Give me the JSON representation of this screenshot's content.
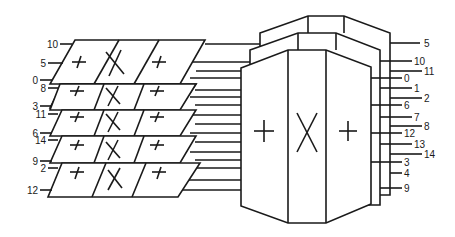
{
  "diagram": {
    "colors": {
      "line": "#1a1a1a",
      "background": "#ffffff"
    },
    "left_labels": [
      "10",
      "5",
      "0",
      "8",
      "3",
      "11",
      "6",
      "14",
      "9",
      "2",
      "12"
    ],
    "right_labels": [
      "5",
      "10",
      "11",
      "0",
      "1",
      "2",
      "6",
      "7",
      "8",
      "12",
      "13",
      "14",
      "3",
      "4",
      "9"
    ],
    "plate_symbols": [
      "+",
      "X",
      "+"
    ],
    "block_symbols": [
      "+",
      "X",
      "+"
    ]
  }
}
